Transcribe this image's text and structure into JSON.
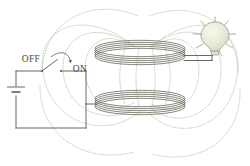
{
  "diagram": {
    "labels": {
      "off": "OFF",
      "on": "ON"
    },
    "colors": {
      "wire": "#585a50",
      "coil": "#5d6152",
      "field_line": "#8d8f80",
      "bulb_fill": "#e9e9dc",
      "bulb_stroke": "#9a9a8a",
      "background": "#ffffff",
      "text": "#4a4a42"
    },
    "components": {
      "battery": {
        "name": "battery-cell"
      },
      "switch": {
        "name": "toggle-switch",
        "state_label_open": "OFF",
        "state_label_closed": "ON"
      },
      "primary_coil": {
        "name": "primary-coil",
        "turns": 5
      },
      "secondary_coil": {
        "name": "secondary-coil",
        "turns": 5
      },
      "lamp": {
        "name": "light-bulb",
        "emitting": true,
        "rays": 8
      },
      "field": {
        "name": "magnetic-field-lines",
        "line_count": 10
      }
    }
  }
}
